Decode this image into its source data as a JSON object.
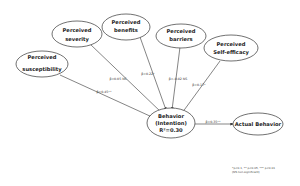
{
  "diagram": {
    "nodes": {
      "susceptibility": {
        "line1": "Perceived",
        "line2": "susceptibility"
      },
      "severity": {
        "line1": "Perceived",
        "line2": "severity"
      },
      "benefits": {
        "line1": "Perceived",
        "line2": "benefits"
      },
      "barriers": {
        "line1": "Perceived",
        "line2": "barriers"
      },
      "self_efficacy": {
        "line1": "Perceived",
        "line2": "Self-efficacy"
      },
      "behavior": {
        "line1": "Behavior",
        "line2": "(Intention)",
        "line3": "R²=0.30"
      },
      "actual": {
        "line1": "Actual Behavior"
      }
    },
    "edges": {
      "susceptibility": "β=0.45**",
      "severity": "β=0.05 NS",
      "benefits": "β=0.22*",
      "barriers": "β=-0.02 NS",
      "self_efficacy": "β=0.17*",
      "actual": "β=0.35**"
    },
    "footnote": {
      "line1": "*p<0.1, ** p<0.05, *** p<0.01",
      "line2": "(NS non-significant)"
    },
    "colors": {
      "stroke": "#333333",
      "text": "#222222"
    }
  }
}
